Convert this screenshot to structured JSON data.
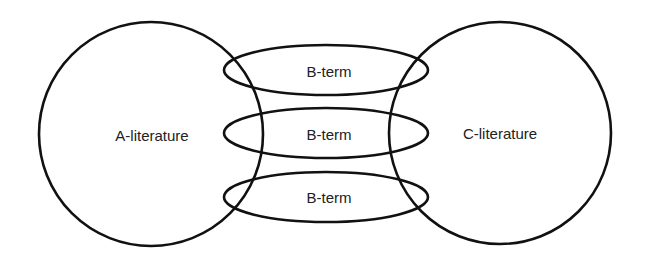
{
  "diagram": {
    "type": "literature-based discovery (Swanson ABC model)",
    "nodes": {
      "a_literature": {
        "label": "A-literature"
      },
      "c_literature": {
        "label": "C-literature"
      },
      "b_terms": [
        {
          "label": "B-term"
        },
        {
          "label": "B-term"
        },
        {
          "label": "B-term"
        }
      ]
    },
    "colors": {
      "stroke": "#111111",
      "text": "#222222",
      "background": "#ffffff"
    }
  }
}
